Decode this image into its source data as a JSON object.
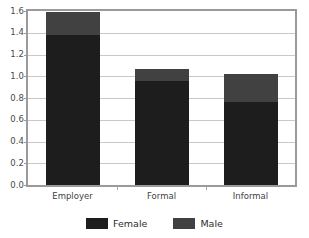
{
  "chart_data": {
    "type": "bar",
    "subtype": "stacked-vertical",
    "title": "",
    "subtitle": "",
    "xlabel": "",
    "ylabel": "",
    "categories": [
      "Employer",
      "Formal",
      "Informal"
    ],
    "series": [
      {
        "name": "Female",
        "color": "#1d1d1d",
        "values": [
          1.375,
          0.955,
          0.76
        ]
      },
      {
        "name": "Male",
        "color": "#414141",
        "values": [
          0.215,
          0.115,
          0.26
        ]
      }
    ],
    "stack_totals": [
      1.59,
      1.07,
      1.02
    ],
    "ylim": [
      0.0,
      1.6
    ],
    "ytick_step": 0.2,
    "ytick_labels": [
      "0.0",
      "0.2",
      "0.4",
      "0.6",
      "0.8",
      "1.0",
      "1.2",
      "1.4",
      "1.6"
    ],
    "ytick_values": [
      0.0,
      0.2,
      0.4,
      0.6,
      0.8,
      1.0,
      1.2,
      1.4,
      1.6
    ],
    "grid": true,
    "grid_axis": "y",
    "legend_position": "bottom",
    "legend_entries": [
      "Female",
      "Male"
    ],
    "plot_background": "#ffffff",
    "border_color": "#9a9a9a",
    "gridline_color": "#c8c8c8"
  }
}
